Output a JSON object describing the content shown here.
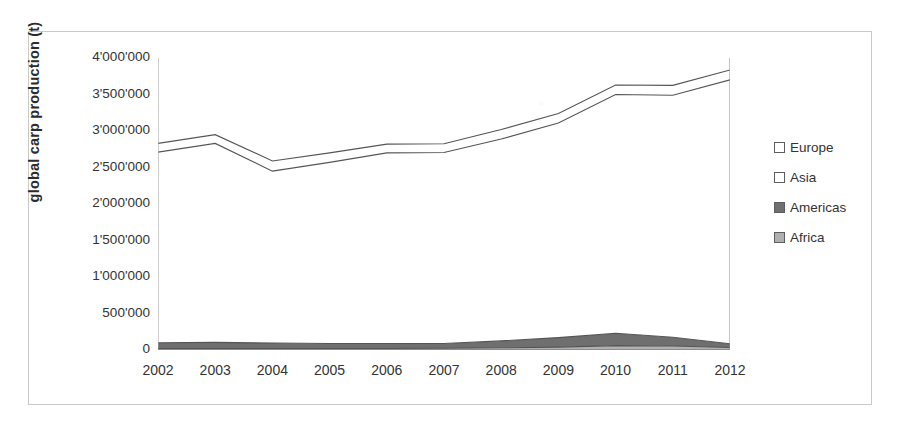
{
  "chart_data": {
    "type": "area",
    "title": "",
    "subtitle": "",
    "xlabel": "",
    "ylabel": "global carp production (t)",
    "stacked": true,
    "grid": false,
    "legend_position": "right",
    "categories": [
      "2002",
      "2003",
      "2004",
      "2005",
      "2006",
      "2007",
      "2008",
      "2009",
      "2010",
      "2011",
      "2012"
    ],
    "x": [
      2002,
      2003,
      2004,
      2005,
      2006,
      2007,
      2008,
      2009,
      2010,
      2011,
      2012
    ],
    "xlim": [
      2002,
      2012
    ],
    "ylim": [
      0,
      4000000
    ],
    "yticks": [
      0,
      500000,
      1000000,
      1500000,
      2000000,
      2500000,
      3000000,
      3500000,
      4000000
    ],
    "ytick_labels": [
      "0",
      "500'000",
      "1'000'000",
      "1'500'000",
      "2'000'000",
      "2'500'000",
      "3'000'000",
      "3'500'000",
      "4'000'000"
    ],
    "series": [
      {
        "name": "Africa",
        "color": "#b0b0b0",
        "values": [
          20000,
          20000,
          20000,
          20000,
          20000,
          25000,
          30000,
          40000,
          60000,
          55000,
          35000
        ]
      },
      {
        "name": "Americas",
        "color": "#6f6f6f",
        "values": [
          80000,
          85000,
          75000,
          70000,
          70000,
          65000,
          95000,
          130000,
          170000,
          120000,
          50000
        ]
      },
      {
        "name": "Asia",
        "color": "#ffffff",
        "values": [
          2610000,
          2725000,
          2355000,
          2480000,
          2610000,
          2615000,
          2765000,
          2940000,
          3270000,
          3315000,
          3615000
        ]
      },
      {
        "name": "Europe",
        "color": "#ffffff",
        "values": [
          120000,
          120000,
          140000,
          130000,
          120000,
          120000,
          130000,
          130000,
          130000,
          135000,
          135000
        ]
      }
    ],
    "cumulative_totals": [
      2830000,
      2950000,
      2590000,
      2700000,
      2820000,
      2825000,
      3020000,
      3240000,
      3630000,
      3625000,
      3835000
    ],
    "annotations": []
  },
  "legend": {
    "items": [
      {
        "label": "Europe",
        "color": "#ffffff"
      },
      {
        "label": "Asia",
        "color": "#ffffff"
      },
      {
        "label": "Americas",
        "color": "#6f6f6f"
      },
      {
        "label": "Africa",
        "color": "#b0b0b0"
      }
    ]
  },
  "axes": {
    "y_title": "global carp production (t)"
  }
}
